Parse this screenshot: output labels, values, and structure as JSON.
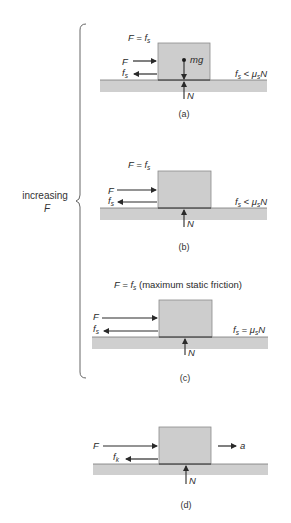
{
  "figure": {
    "side_label": {
      "line1": "increasing",
      "line2": "F"
    },
    "colors": {
      "block": "#cdcdcd",
      "block_edge": "#8a8a8a",
      "ground": "#cfcfcf",
      "arrow": "#2a2a2a",
      "text": "#2a2a2a"
    },
    "panels": [
      {
        "id": "a",
        "caption": "(a)",
        "title_main": "F = f",
        "title_sub": "s",
        "title_extra": "",
        "force_F": "F",
        "friction_main": "f",
        "friction_sub": "s",
        "weight_label": "mg",
        "normal_label": "N",
        "condition": {
          "lhs": "f",
          "lhs_sub": "s",
          "op": " < ",
          "mu": "μ",
          "mu_sub": "s",
          "rhs": "N"
        }
      },
      {
        "id": "b",
        "caption": "(b)",
        "title_main": "F = f",
        "title_sub": "s",
        "title_extra": "",
        "force_F": "F",
        "friction_main": "f",
        "friction_sub": "s",
        "normal_label": "N",
        "condition": {
          "lhs": "f",
          "lhs_sub": "s",
          "op": " < ",
          "mu": "μ",
          "mu_sub": "s",
          "rhs": "N"
        }
      },
      {
        "id": "c",
        "caption": "(c)",
        "title_main": "F = f",
        "title_sub": "s",
        "title_extra": " (maximum static friction)",
        "force_F": "F",
        "friction_main": "f",
        "friction_sub": "s",
        "normal_label": "N",
        "condition": {
          "lhs": "f",
          "lhs_sub": "s",
          "op": " = ",
          "mu": "μ",
          "mu_sub": "s",
          "rhs": "N"
        }
      },
      {
        "id": "d",
        "caption": "(d)",
        "force_F": "F",
        "friction_main": "f",
        "friction_sub": "k",
        "normal_label": "N",
        "accel_label": "a"
      }
    ]
  }
}
